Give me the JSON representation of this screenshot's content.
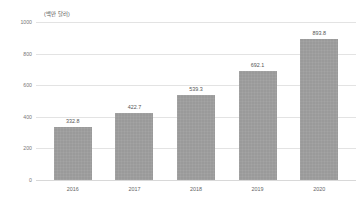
{
  "chart_data": {
    "type": "bar",
    "title": "",
    "subtitle": "",
    "unit_label": "(백만 달러)",
    "xlabel": "",
    "ylabel": "",
    "categories": [
      "2016",
      "2017",
      "2018",
      "2019",
      "2020"
    ],
    "values": [
      332.8,
      422.7,
      539.3,
      692.1,
      893.8
    ],
    "value_labels": [
      "332.8",
      "422.7",
      "539.3",
      "692.1",
      "893.8"
    ],
    "ylim": [
      0,
      1000
    ],
    "ytick_values": [
      1000,
      800,
      600,
      400,
      200,
      0
    ],
    "ytick_labels": [
      "1000",
      "800",
      "600",
      "400",
      "200",
      "0"
    ],
    "grid": true,
    "grid_axis": "y",
    "legend": false,
    "legend_position": "none",
    "series": [
      {
        "name": "",
        "values": [
          332.8,
          422.7,
          539.3,
          692.1,
          893.8
        ]
      }
    ]
  },
  "style": {
    "bar_color": "#9a9a9a",
    "grid_color": "#e3e3e3",
    "baseline_color": "#d8d8d8",
    "label_color": "#555555",
    "tick_color": "#777777",
    "background": "#ffffff"
  }
}
